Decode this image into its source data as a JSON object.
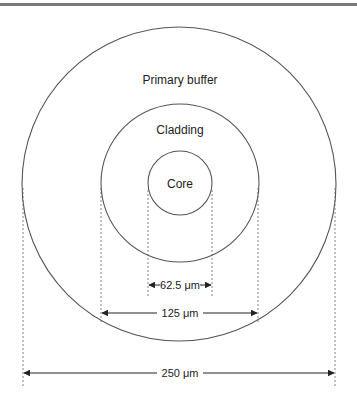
{
  "diagram": {
    "layers": [
      {
        "name": "Primary buffer",
        "diameter": "250 μm"
      },
      {
        "name": "Cladding",
        "diameter": "125 μm"
      },
      {
        "name": "Core",
        "diameter": "62.5 μm"
      }
    ],
    "labels": {
      "primary_buffer": "Primary buffer",
      "cladding": "Cladding",
      "core": "Core"
    },
    "dimensions": {
      "core": "62.5 μm",
      "cladding": "125 μm",
      "buffer": "250 μm"
    },
    "colors": {
      "stroke": "#555555",
      "text": "#222222",
      "border": "#7a7a7a"
    }
  }
}
